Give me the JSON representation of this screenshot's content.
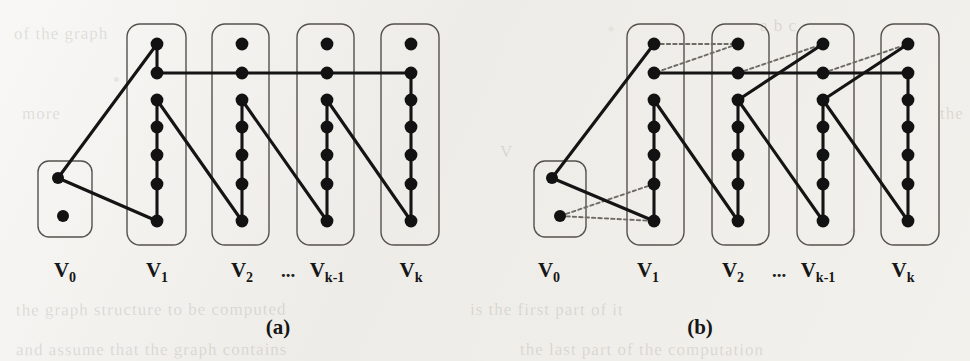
{
  "figure": {
    "background_color": "#efeeea",
    "ink_color": "#141414",
    "box_stroke_color": "#55524d",
    "dotted_edge_color": "#6e6b66",
    "panels": [
      {
        "id": "a",
        "caption": "(a)",
        "caption_x": 278,
        "caption_y": 334,
        "origin_x": 0,
        "column_labels": [
          {
            "base": "V",
            "sub": "0",
            "x": 65,
            "y": 277
          },
          {
            "base": "V",
            "sub": "1",
            "x": 157,
            "y": 277
          },
          {
            "base": "V",
            "sub": "2",
            "x": 242,
            "y": 277
          },
          {
            "base": "V",
            "sub": "k-1",
            "x": 327,
            "y": 277
          },
          {
            "base": "V",
            "sub": "k",
            "x": 411,
            "y": 277
          }
        ],
        "ellipsis": {
          "text": "...",
          "x": 288,
          "y": 277
        },
        "boxes": [
          {
            "name": "group-v0",
            "x": 38,
            "y": 161,
            "w": 54,
            "h": 76,
            "r": 11
          },
          {
            "name": "group-v1",
            "x": 127,
            "y": 24,
            "w": 59,
            "h": 221,
            "r": 13
          },
          {
            "name": "group-v2",
            "x": 212,
            "y": 24,
            "w": 57,
            "h": 221,
            "r": 13
          },
          {
            "name": "group-vk-1",
            "x": 297,
            "y": 24,
            "w": 57,
            "h": 221,
            "r": 13
          },
          {
            "name": "group-vk",
            "x": 381,
            "y": 24,
            "w": 58,
            "h": 221,
            "r": 13
          }
        ],
        "vertices": [
          {
            "id": "v0_1",
            "x": 58,
            "y": 178,
            "r": 6
          },
          {
            "id": "v0_2",
            "x": 63,
            "y": 216,
            "r": 6
          },
          {
            "id": "v1_1",
            "x": 157,
            "y": 44,
            "r": 6.4
          },
          {
            "id": "v1_2",
            "x": 157,
            "y": 73,
            "r": 6.4
          },
          {
            "id": "v1_3",
            "x": 157,
            "y": 100,
            "r": 6.4
          },
          {
            "id": "v1_4",
            "x": 157,
            "y": 127,
            "r": 6.4
          },
          {
            "id": "v1_5",
            "x": 157,
            "y": 155,
            "r": 6.4
          },
          {
            "id": "v1_6",
            "x": 157,
            "y": 184,
            "r": 6.4
          },
          {
            "id": "v1_7",
            "x": 157,
            "y": 221,
            "r": 6.4
          },
          {
            "id": "v2_1",
            "x": 242,
            "y": 44,
            "r": 6.4
          },
          {
            "id": "v2_2",
            "x": 242,
            "y": 73,
            "r": 6.4
          },
          {
            "id": "v2_3",
            "x": 242,
            "y": 100,
            "r": 6.4
          },
          {
            "id": "v2_4",
            "x": 242,
            "y": 127,
            "r": 6.4
          },
          {
            "id": "v2_5",
            "x": 242,
            "y": 155,
            "r": 6.4
          },
          {
            "id": "v2_6",
            "x": 242,
            "y": 184,
            "r": 6.4
          },
          {
            "id": "v2_7",
            "x": 242,
            "y": 221,
            "r": 6.4
          },
          {
            "id": "vk1_1",
            "x": 327,
            "y": 44,
            "r": 6.4
          },
          {
            "id": "vk1_2",
            "x": 327,
            "y": 73,
            "r": 6.4
          },
          {
            "id": "vk1_3",
            "x": 327,
            "y": 100,
            "r": 6.4
          },
          {
            "id": "vk1_4",
            "x": 327,
            "y": 127,
            "r": 6.4
          },
          {
            "id": "vk1_5",
            "x": 327,
            "y": 155,
            "r": 6.4
          },
          {
            "id": "vk1_6",
            "x": 327,
            "y": 184,
            "r": 6.4
          },
          {
            "id": "vk1_7",
            "x": 327,
            "y": 221,
            "r": 6.4
          },
          {
            "id": "vk_1",
            "x": 411,
            "y": 44,
            "r": 6.4
          },
          {
            "id": "vk_2",
            "x": 411,
            "y": 73,
            "r": 6.4
          },
          {
            "id": "vk_3",
            "x": 411,
            "y": 100,
            "r": 6.4
          },
          {
            "id": "vk_4",
            "x": 411,
            "y": 127,
            "r": 6.4
          },
          {
            "id": "vk_5",
            "x": 411,
            "y": 155,
            "r": 6.4
          },
          {
            "id": "vk_6",
            "x": 411,
            "y": 184,
            "r": 6.4
          },
          {
            "id": "vk_7",
            "x": 411,
            "y": 221,
            "r": 6.4
          }
        ],
        "edges_solid": [
          {
            "x1": 58,
            "y1": 178,
            "x2": 157,
            "y2": 44
          },
          {
            "x1": 58,
            "y1": 178,
            "x2": 157,
            "y2": 221
          },
          {
            "x1": 157,
            "y1": 44,
            "x2": 157,
            "y2": 73
          },
          {
            "x1": 157,
            "y1": 73,
            "x2": 411,
            "y2": 73
          },
          {
            "x1": 411,
            "y1": 73,
            "x2": 411,
            "y2": 221
          },
          {
            "x1": 157,
            "y1": 100,
            "x2": 157,
            "y2": 221
          },
          {
            "x1": 157,
            "y1": 100,
            "x2": 242,
            "y2": 221
          },
          {
            "x1": 242,
            "y1": 100,
            "x2": 242,
            "y2": 221
          },
          {
            "x1": 242,
            "y1": 100,
            "x2": 327,
            "y2": 221
          },
          {
            "x1": 327,
            "y1": 100,
            "x2": 327,
            "y2": 221
          },
          {
            "x1": 327,
            "y1": 100,
            "x2": 411,
            "y2": 221
          }
        ],
        "edges_dotted": []
      },
      {
        "id": "b",
        "caption": "(b)",
        "caption_x": 700,
        "caption_y": 334,
        "origin_x": 485,
        "column_labels": [
          {
            "base": "V",
            "sub": "0",
            "x": 549,
            "y": 277
          },
          {
            "base": "V",
            "sub": "1",
            "x": 648,
            "y": 277
          },
          {
            "base": "V",
            "sub": "2",
            "x": 733,
            "y": 277
          },
          {
            "base": "V",
            "sub": "k-1",
            "x": 818,
            "y": 277
          },
          {
            "base": "V",
            "sub": "k",
            "x": 903,
            "y": 277
          }
        ],
        "ellipsis": {
          "text": "...",
          "x": 779,
          "y": 277
        },
        "boxes": [
          {
            "name": "group-v0",
            "x": 534,
            "y": 161,
            "w": 52,
            "h": 76,
            "r": 11
          },
          {
            "name": "group-v1",
            "x": 627,
            "y": 24,
            "w": 57,
            "h": 221,
            "r": 13
          },
          {
            "name": "group-v2",
            "x": 712,
            "y": 24,
            "w": 57,
            "h": 221,
            "r": 13
          },
          {
            "name": "group-vk-1",
            "x": 797,
            "y": 24,
            "w": 57,
            "h": 221,
            "r": 13
          },
          {
            "name": "group-vk",
            "x": 881,
            "y": 24,
            "w": 58,
            "h": 221,
            "r": 13
          }
        ],
        "vertices": [
          {
            "id": "v0_1",
            "x": 552,
            "y": 178,
            "r": 6
          },
          {
            "id": "v0_2",
            "x": 560,
            "y": 216,
            "r": 6
          },
          {
            "id": "v1_1",
            "x": 654,
            "y": 44,
            "r": 6.4
          },
          {
            "id": "v1_2",
            "x": 654,
            "y": 73,
            "r": 6.4
          },
          {
            "id": "v1_3",
            "x": 654,
            "y": 100,
            "r": 6.4
          },
          {
            "id": "v1_4",
            "x": 654,
            "y": 127,
            "r": 6.4
          },
          {
            "id": "v1_5",
            "x": 654,
            "y": 155,
            "r": 6.4
          },
          {
            "id": "v1_6",
            "x": 654,
            "y": 184,
            "r": 6.4
          },
          {
            "id": "v1_7",
            "x": 654,
            "y": 221,
            "r": 6.4
          },
          {
            "id": "v2_1",
            "x": 738,
            "y": 44,
            "r": 6.4
          },
          {
            "id": "v2_2",
            "x": 738,
            "y": 73,
            "r": 6.4
          },
          {
            "id": "v2_3",
            "x": 738,
            "y": 100,
            "r": 6.4
          },
          {
            "id": "v2_4",
            "x": 738,
            "y": 127,
            "r": 6.4
          },
          {
            "id": "v2_5",
            "x": 738,
            "y": 155,
            "r": 6.4
          },
          {
            "id": "v2_6",
            "x": 738,
            "y": 184,
            "r": 6.4
          },
          {
            "id": "v2_7",
            "x": 738,
            "y": 221,
            "r": 6.4
          },
          {
            "id": "vk1_1",
            "x": 823,
            "y": 44,
            "r": 6.4
          },
          {
            "id": "vk1_2",
            "x": 823,
            "y": 73,
            "r": 6.4
          },
          {
            "id": "vk1_3",
            "x": 823,
            "y": 100,
            "r": 6.4
          },
          {
            "id": "vk1_4",
            "x": 823,
            "y": 127,
            "r": 6.4
          },
          {
            "id": "vk1_5",
            "x": 823,
            "y": 155,
            "r": 6.4
          },
          {
            "id": "vk1_6",
            "x": 823,
            "y": 184,
            "r": 6.4
          },
          {
            "id": "vk1_7",
            "x": 823,
            "y": 221,
            "r": 6.4
          },
          {
            "id": "vk_1",
            "x": 908,
            "y": 44,
            "r": 6.4
          },
          {
            "id": "vk_2",
            "x": 908,
            "y": 73,
            "r": 6.4
          },
          {
            "id": "vk_3",
            "x": 908,
            "y": 100,
            "r": 6.4
          },
          {
            "id": "vk_4",
            "x": 908,
            "y": 127,
            "r": 6.4
          },
          {
            "id": "vk_5",
            "x": 908,
            "y": 155,
            "r": 6.4
          },
          {
            "id": "vk_6",
            "x": 908,
            "y": 184,
            "r": 6.4
          },
          {
            "id": "vk_7",
            "x": 908,
            "y": 221,
            "r": 6.4
          }
        ],
        "edges_solid": [
          {
            "x1": 552,
            "y1": 178,
            "x2": 654,
            "y2": 44
          },
          {
            "x1": 552,
            "y1": 178,
            "x2": 654,
            "y2": 221
          },
          {
            "x1": 654,
            "y1": 73,
            "x2": 908,
            "y2": 73
          },
          {
            "x1": 908,
            "y1": 73,
            "x2": 908,
            "y2": 221
          },
          {
            "x1": 654,
            "y1": 100,
            "x2": 654,
            "y2": 221
          },
          {
            "x1": 654,
            "y1": 100,
            "x2": 738,
            "y2": 221
          },
          {
            "x1": 738,
            "y1": 100,
            "x2": 738,
            "y2": 221
          },
          {
            "x1": 738,
            "y1": 100,
            "x2": 823,
            "y2": 221
          },
          {
            "x1": 823,
            "y1": 100,
            "x2": 823,
            "y2": 221
          },
          {
            "x1": 823,
            "y1": 100,
            "x2": 908,
            "y2": 221
          },
          {
            "x1": 738,
            "y1": 100,
            "x2": 823,
            "y2": 44
          },
          {
            "x1": 823,
            "y1": 100,
            "x2": 908,
            "y2": 44
          }
        ],
        "edges_dotted": [
          {
            "x1": 654,
            "y1": 44,
            "x2": 738,
            "y2": 44
          },
          {
            "x1": 738,
            "y1": 44,
            "x2": 654,
            "y2": 73
          },
          {
            "x1": 738,
            "y1": 100,
            "x2": 823,
            "y2": 44
          },
          {
            "x1": 823,
            "y1": 100,
            "x2": 908,
            "y2": 44
          },
          {
            "x1": 738,
            "y1": 73,
            "x2": 823,
            "y2": 44
          },
          {
            "x1": 823,
            "y1": 73,
            "x2": 908,
            "y2": 44
          },
          {
            "x1": 560,
            "y1": 216,
            "x2": 654,
            "y2": 184
          },
          {
            "x1": 560,
            "y1": 216,
            "x2": 654,
            "y2": 221
          }
        ]
      }
    ],
    "bleed_lines": [
      {
        "text": "of the graph",
        "x": 14,
        "y": 24,
        "rot": -0.4
      },
      {
        "text": "a b c",
        "x": 760,
        "y": 16,
        "rot": 0.3
      },
      {
        "text": "more",
        "x": 22,
        "y": 104,
        "rot": 0.2
      },
      {
        "text": "the",
        "x": 940,
        "y": 104,
        "rot": 0.0
      },
      {
        "text": "V",
        "x": 500,
        "y": 142,
        "rot": 0.0
      },
      {
        "text": "the graph structure to be computed",
        "x": 16,
        "y": 300,
        "rot": -0.2
      },
      {
        "text": "is the first part of it",
        "x": 470,
        "y": 300,
        "rot": 0.2
      },
      {
        "text": "and assume that the graph contains",
        "x": 16,
        "y": 340,
        "rot": -0.1
      },
      {
        "text": "the last part of the computation",
        "x": 520,
        "y": 340,
        "rot": 0.1
      }
    ]
  }
}
